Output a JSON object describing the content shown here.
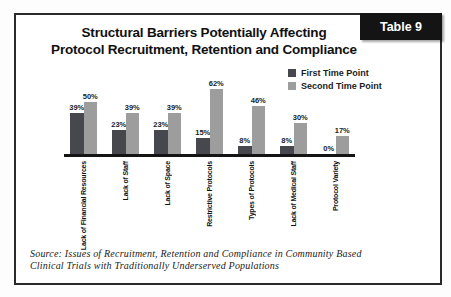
{
  "badge": {
    "label": "Table 9"
  },
  "title": {
    "line1": "Structural Barriers Potentially Affecting",
    "line2": "Protocol Recruitment, Retention and Compliance"
  },
  "source": {
    "line1": "Source: Issues of Recruitment, Retention and Compliance in Community Based",
    "line2": "Clinical Trials with Traditionally Underserved Populations"
  },
  "chart_data": {
    "type": "bar",
    "categories": [
      "Lack of Financial Resources",
      "Lack of Staff",
      "Lack of Space",
      "Restrictive Protocols",
      "Types of Protocols",
      "Lack of Medical Staff",
      "Protocol Variety"
    ],
    "series": [
      {
        "name": "First Time Point",
        "color": "#47474e",
        "values": [
          39,
          23,
          23,
          15,
          8,
          8,
          0
        ]
      },
      {
        "name": "Second Time Point",
        "color": "#9d9d9d",
        "values": [
          50,
          39,
          39,
          62,
          46,
          30,
          17
        ]
      }
    ],
    "value_suffix": "%",
    "ylim": [
      0,
      70
    ],
    "grid": false,
    "legend_position": "top-right",
    "axis_color": "#141414"
  }
}
